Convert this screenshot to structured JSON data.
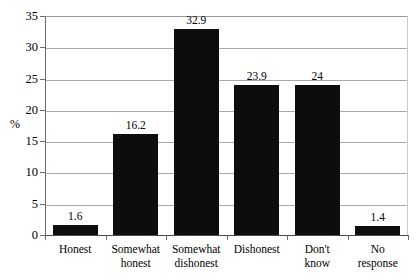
{
  "chart_data": {
    "type": "bar",
    "title": "",
    "xlabel": "",
    "ylabel": "%",
    "ylim": [
      0,
      35
    ],
    "ytick_step": 5,
    "yticks": [
      "35",
      "30",
      "25",
      "20",
      "15",
      "10",
      "5",
      "0"
    ],
    "grid": true,
    "legend": "none",
    "bar_color": "#0d0d0d",
    "categories": [
      "Honest",
      "Somewhat\nhonest",
      "Somewhat\ndishonest",
      "Dishonest",
      "Don't\nknow",
      "No\nresponse"
    ],
    "values": [
      1.6,
      16.2,
      32.9,
      23.9,
      24,
      1.4
    ],
    "value_labels": [
      "1.6",
      "16.2",
      "32.9",
      "23.9",
      "24",
      "1.4"
    ]
  }
}
